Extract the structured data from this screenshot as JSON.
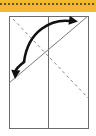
{
  "page": {
    "background_color": "#ffffff",
    "width": 96,
    "height": 136
  },
  "top_band": {
    "name": "orange-highlight-band",
    "fill_color": "#f5b731",
    "x": 0,
    "y": 0,
    "width": 96,
    "height": 12,
    "divider": {
      "name": "dashed-divider-line",
      "color": "#3a3228",
      "y": 4,
      "dash_pattern": "2 2",
      "stroke_width": 1.4
    }
  },
  "diagram": {
    "sheet": {
      "name": "paper-sheet-rectangle",
      "x": 9,
      "y": 16,
      "width": 79,
      "height": 112,
      "fill_color": "#ffffff",
      "stroke_color": "#6b6b6b",
      "stroke_width": 1
    },
    "creases": [
      {
        "name": "vertical-center-crease",
        "style": "solid",
        "color": "#6b6b6b",
        "x1": 48.5,
        "y1": 16,
        "x2": 48.5,
        "y2": 128
      },
      {
        "name": "solid-diagonal-fold-line",
        "style": "solid",
        "color": "#7a7a7a",
        "x1": 9,
        "y1": 83,
        "x2": 88,
        "y2": 16
      },
      {
        "name": "dashed-diagonal-valley-fold-line",
        "style": "dashed",
        "color": "#8a8a8a",
        "dash_pattern": "3 3",
        "x1": 13,
        "y1": 19,
        "x2": 88,
        "y2": 98
      }
    ],
    "arrows": [
      {
        "name": "fold-arrow-right",
        "color": "#111111",
        "stroke_width": 2.6,
        "path": "M 24 62 C 28 30 52 19 70 21",
        "head": {
          "tip_x": 78,
          "tip_y": 21.5,
          "angle_deg": 8
        }
      },
      {
        "name": "fold-arrow-down-left",
        "color": "#111111",
        "stroke_width": 2.6,
        "path": "M 24 62 C 19 66 16 69 15.5 71",
        "head": {
          "tip_x": 15,
          "tip_y": 79,
          "angle_deg": 95
        }
      }
    ]
  }
}
